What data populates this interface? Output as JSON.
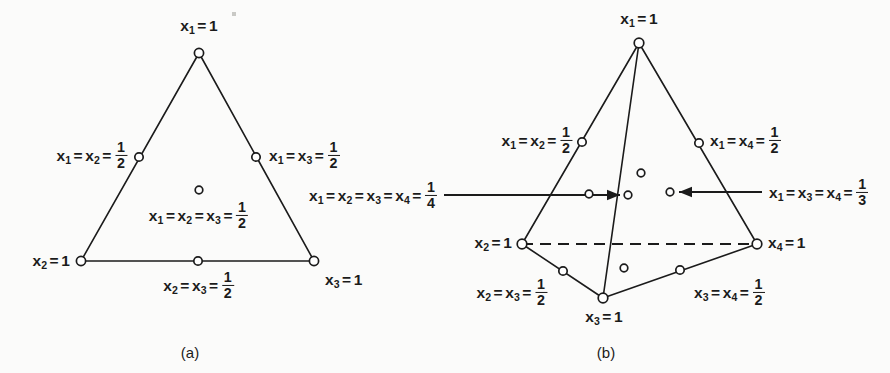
{
  "figure": {
    "background": "#fbfbfa",
    "ink": "#1b1b1b",
    "width": 890,
    "height": 373,
    "panels": [
      {
        "id": "a",
        "caption": "(a)",
        "caption_x": 190,
        "caption_y": 352,
        "shape": "triangle",
        "title": "2-simplex (triangle) with node labels"
      },
      {
        "id": "b",
        "caption": "(b)",
        "caption_x": 606,
        "caption_y": 352,
        "shape": "tetrahedron",
        "title": "3-simplex (tetrahedron) with node labels"
      }
    ]
  },
  "panel_a": {
    "vertices": {
      "top": {
        "x": 199,
        "y": 53
      },
      "bottom_left": {
        "x": 81,
        "y": 261
      },
      "bottom_right": {
        "x": 314,
        "y": 261
      }
    },
    "nodes": [
      {
        "name": "vertex-x1",
        "x": 199,
        "y": 53,
        "r": 4.6
      },
      {
        "name": "vertex-x2",
        "x": 81,
        "y": 261,
        "r": 4.6
      },
      {
        "name": "vertex-x3",
        "x": 314,
        "y": 261,
        "r": 4.6
      },
      {
        "name": "midpoint-x1x2",
        "x": 139,
        "y": 157,
        "r": 4.2
      },
      {
        "name": "midpoint-x1x3",
        "x": 256,
        "y": 157,
        "r": 4.2
      },
      {
        "name": "midpoint-x2x3",
        "x": 198,
        "y": 261,
        "r": 4.2
      },
      {
        "name": "interior-centroid",
        "x": 199,
        "y": 190,
        "r": 3.8
      }
    ],
    "labels": [
      {
        "name": "label-x1-eq-1",
        "x": 199,
        "y": 27,
        "anchor": "mid",
        "parts": [
          {
            "t": "var",
            "v": "x",
            "sub": "1"
          },
          {
            "t": "op",
            "v": "="
          },
          {
            "t": "num",
            "v": "1"
          }
        ]
      },
      {
        "name": "label-x1-x2-half",
        "x": 128,
        "y": 155,
        "anchor": "end",
        "parts": [
          {
            "t": "var",
            "v": "x",
            "sub": "1"
          },
          {
            "t": "op",
            "v": "="
          },
          {
            "t": "var",
            "v": "x",
            "sub": "2"
          },
          {
            "t": "op",
            "v": "="
          },
          {
            "t": "frac",
            "num": "1",
            "den": "2"
          }
        ]
      },
      {
        "name": "label-x1-x3-half",
        "x": 269,
        "y": 155,
        "anchor": "start",
        "parts": [
          {
            "t": "var",
            "v": "x",
            "sub": "1"
          },
          {
            "t": "op",
            "v": "="
          },
          {
            "t": "var",
            "v": "x",
            "sub": "3"
          },
          {
            "t": "op",
            "v": "="
          },
          {
            "t": "frac",
            "num": "1",
            "den": "2"
          }
        ]
      },
      {
        "name": "label-centroid-half",
        "x": 199,
        "y": 215,
        "anchor": "mid",
        "parts": [
          {
            "t": "var",
            "v": "x",
            "sub": "1"
          },
          {
            "t": "op",
            "v": "="
          },
          {
            "t": "var",
            "v": "x",
            "sub": "2"
          },
          {
            "t": "op",
            "v": "="
          },
          {
            "t": "var",
            "v": "x",
            "sub": "3"
          },
          {
            "t": "op",
            "v": "="
          },
          {
            "t": "frac",
            "num": "1",
            "den": "2"
          }
        ]
      },
      {
        "name": "label-x2-eq-1",
        "x": 70,
        "y": 262,
        "anchor": "end",
        "parts": [
          {
            "t": "var",
            "v": "x",
            "sub": "2"
          },
          {
            "t": "op",
            "v": "="
          },
          {
            "t": "num",
            "v": "1"
          }
        ]
      },
      {
        "name": "label-x3-eq-1",
        "x": 325,
        "y": 281,
        "anchor": "start",
        "parts": [
          {
            "t": "var",
            "v": "x",
            "sub": "3"
          },
          {
            "t": "op",
            "v": "="
          },
          {
            "t": "num",
            "v": "1"
          }
        ]
      },
      {
        "name": "label-x2-x3-half",
        "x": 199,
        "y": 285,
        "anchor": "mid",
        "parts": [
          {
            "t": "var",
            "v": "x",
            "sub": "2"
          },
          {
            "t": "op",
            "v": "="
          },
          {
            "t": "var",
            "v": "x",
            "sub": "3"
          },
          {
            "t": "op",
            "v": "="
          },
          {
            "t": "frac",
            "num": "1",
            "den": "2"
          }
        ]
      }
    ]
  },
  "panel_b": {
    "vertices": {
      "apex_x1": {
        "x": 639,
        "y": 43
      },
      "left_x2": {
        "x": 522,
        "y": 244
      },
      "front_x3": {
        "x": 603,
        "y": 298
      },
      "right_x4": {
        "x": 757,
        "y": 244
      }
    },
    "edges": [
      {
        "name": "edge-x1-x2",
        "from": "apex_x1",
        "to": "left_x2",
        "style": "solid"
      },
      {
        "name": "edge-x1-x3",
        "from": "apex_x1",
        "to": "front_x3",
        "style": "solid"
      },
      {
        "name": "edge-x1-x4",
        "from": "apex_x1",
        "to": "right_x4",
        "style": "solid"
      },
      {
        "name": "edge-x2-x3",
        "from": "left_x2",
        "to": "front_x3",
        "style": "solid"
      },
      {
        "name": "edge-x3-x4",
        "from": "front_x3",
        "to": "right_x4",
        "style": "solid"
      },
      {
        "name": "edge-x2-x4",
        "from": "left_x2",
        "to": "right_x4",
        "style": "dashed"
      }
    ],
    "nodes": [
      {
        "name": "vertex-x1",
        "x": 639,
        "y": 43,
        "r": 4.8
      },
      {
        "name": "vertex-x2",
        "x": 522,
        "y": 244,
        "r": 4.8
      },
      {
        "name": "vertex-x3",
        "x": 603,
        "y": 298,
        "r": 4.8
      },
      {
        "name": "vertex-x4",
        "x": 757,
        "y": 244,
        "r": 4.8
      },
      {
        "name": "midpoint-x1x2",
        "x": 582,
        "y": 142,
        "r": 4.2
      },
      {
        "name": "midpoint-x1x4",
        "x": 699,
        "y": 143,
        "r": 4.2
      },
      {
        "name": "midpoint-x2x3",
        "x": 563,
        "y": 271,
        "r": 4.2
      },
      {
        "name": "midpoint-x3x4",
        "x": 680,
        "y": 270,
        "r": 4.2
      },
      {
        "name": "interior-face-upper",
        "x": 641,
        "y": 173,
        "r": 3.8
      },
      {
        "name": "interior-face-left",
        "x": 589,
        "y": 194,
        "r": 3.8
      },
      {
        "name": "interior-centroid",
        "x": 628,
        "y": 195,
        "r": 3.8
      },
      {
        "name": "interior-face-right",
        "x": 670,
        "y": 192,
        "r": 3.8
      },
      {
        "name": "interior-face-lower",
        "x": 624,
        "y": 268,
        "r": 3.8
      }
    ],
    "arrows": [
      {
        "name": "arrow-to-centroid",
        "x1": 444,
        "y1": 195,
        "x2": 620,
        "y2": 195,
        "direction": "right"
      },
      {
        "name": "arrow-to-face-right",
        "x1": 762,
        "y1": 192,
        "x2": 679,
        "y2": 192,
        "direction": "left"
      }
    ],
    "labels": [
      {
        "name": "label-x1-eq-1",
        "x": 639,
        "y": 20,
        "anchor": "mid",
        "parts": [
          {
            "t": "var",
            "v": "x",
            "sub": "1"
          },
          {
            "t": "op",
            "v": "="
          },
          {
            "t": "num",
            "v": "1"
          }
        ]
      },
      {
        "name": "label-x1-x2-half",
        "x": 573,
        "y": 140,
        "anchor": "end",
        "parts": [
          {
            "t": "var",
            "v": "x",
            "sub": "1"
          },
          {
            "t": "op",
            "v": "="
          },
          {
            "t": "var",
            "v": "x",
            "sub": "2"
          },
          {
            "t": "op",
            "v": "="
          },
          {
            "t": "frac",
            "num": "1",
            "den": "2"
          }
        ]
      },
      {
        "name": "label-x1-x4-half",
        "x": 710,
        "y": 140,
        "anchor": "start",
        "parts": [
          {
            "t": "var",
            "v": "x",
            "sub": "1"
          },
          {
            "t": "op",
            "v": "="
          },
          {
            "t": "var",
            "v": "x",
            "sub": "4"
          },
          {
            "t": "op",
            "v": "="
          },
          {
            "t": "frac",
            "num": "1",
            "den": "2"
          }
        ]
      },
      {
        "name": "label-centroid-quarter",
        "x": 438,
        "y": 195,
        "anchor": "end",
        "parts": [
          {
            "t": "var",
            "v": "x",
            "sub": "1"
          },
          {
            "t": "op",
            "v": "="
          },
          {
            "t": "var",
            "v": "x",
            "sub": "2"
          },
          {
            "t": "op",
            "v": "="
          },
          {
            "t": "var",
            "v": "x",
            "sub": "3"
          },
          {
            "t": "op",
            "v": "="
          },
          {
            "t": "var",
            "v": "x",
            "sub": "4"
          },
          {
            "t": "op",
            "v": "="
          },
          {
            "t": "frac",
            "num": "1",
            "den": "4"
          }
        ]
      },
      {
        "name": "label-x1-x3-x4-third",
        "x": 769,
        "y": 192,
        "anchor": "start",
        "parts": [
          {
            "t": "var",
            "v": "x",
            "sub": "1"
          },
          {
            "t": "op",
            "v": "="
          },
          {
            "t": "var",
            "v": "x",
            "sub": "3"
          },
          {
            "t": "op",
            "v": "="
          },
          {
            "t": "var",
            "v": "x",
            "sub": "4"
          },
          {
            "t": "op",
            "v": "="
          },
          {
            "t": "frac",
            "num": "1",
            "den": "3"
          }
        ]
      },
      {
        "name": "label-x2-eq-1",
        "x": 512,
        "y": 244,
        "anchor": "end",
        "parts": [
          {
            "t": "var",
            "v": "x",
            "sub": "2"
          },
          {
            "t": "op",
            "v": "="
          },
          {
            "t": "num",
            "v": "1"
          }
        ]
      },
      {
        "name": "label-x4-eq-1",
        "x": 768,
        "y": 244,
        "anchor": "start",
        "parts": [
          {
            "t": "var",
            "v": "x",
            "sub": "4"
          },
          {
            "t": "op",
            "v": "="
          },
          {
            "t": "num",
            "v": "1"
          }
        ]
      },
      {
        "name": "label-x2-x3-half",
        "x": 548,
        "y": 292,
        "anchor": "end",
        "parts": [
          {
            "t": "var",
            "v": "x",
            "sub": "2"
          },
          {
            "t": "op",
            "v": "="
          },
          {
            "t": "var",
            "v": "x",
            "sub": "3"
          },
          {
            "t": "op",
            "v": "="
          },
          {
            "t": "frac",
            "num": "1",
            "den": "2"
          }
        ]
      },
      {
        "name": "label-x3-eq-1",
        "x": 604,
        "y": 318,
        "anchor": "mid",
        "parts": [
          {
            "t": "var",
            "v": "x",
            "sub": "3"
          },
          {
            "t": "op",
            "v": "="
          },
          {
            "t": "num",
            "v": "1"
          }
        ]
      },
      {
        "name": "label-x3-x4-half",
        "x": 694,
        "y": 292,
        "anchor": "start",
        "parts": [
          {
            "t": "var",
            "v": "x",
            "sub": "3"
          },
          {
            "t": "op",
            "v": "="
          },
          {
            "t": "var",
            "v": "x",
            "sub": "4"
          },
          {
            "t": "op",
            "v": "="
          },
          {
            "t": "frac",
            "num": "1",
            "den": "2"
          }
        ]
      }
    ]
  },
  "specks": [
    {
      "name": "scan-speck",
      "x": 232,
      "y": 12,
      "w": 4,
      "h": 4
    }
  ]
}
